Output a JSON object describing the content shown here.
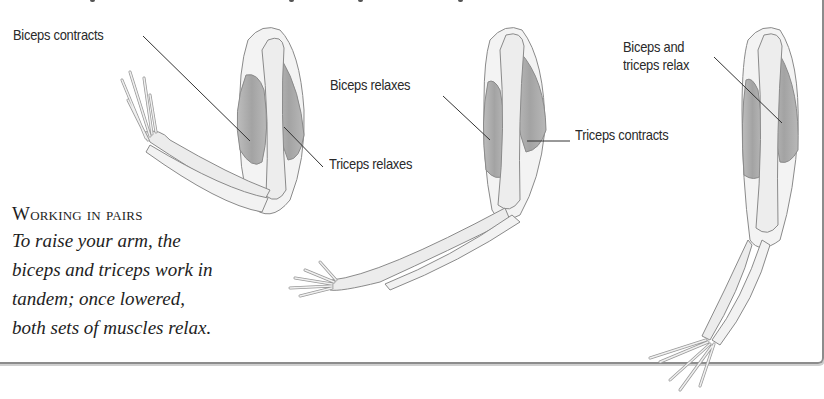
{
  "figure": {
    "labels": {
      "biceps_contracts": "Biceps contracts",
      "triceps_relaxes": "Triceps relaxes",
      "biceps_relaxes": "Biceps relaxes",
      "triceps_contracts": "Triceps contracts",
      "both_relax_line1": "Biceps and",
      "both_relax_line2": "triceps relax"
    },
    "caption": {
      "title": "Working in pairs",
      "lines": [
        "To raise your arm, the",
        "biceps and triceps work in",
        "tandem; once lowered,",
        "both sets of muscles relax."
      ]
    },
    "colors": {
      "muscle": "#a9a9a9",
      "bone": "#ececec",
      "outline": "#8a8a8a",
      "leader": "#333333",
      "frame": "#8c8c8c"
    }
  }
}
